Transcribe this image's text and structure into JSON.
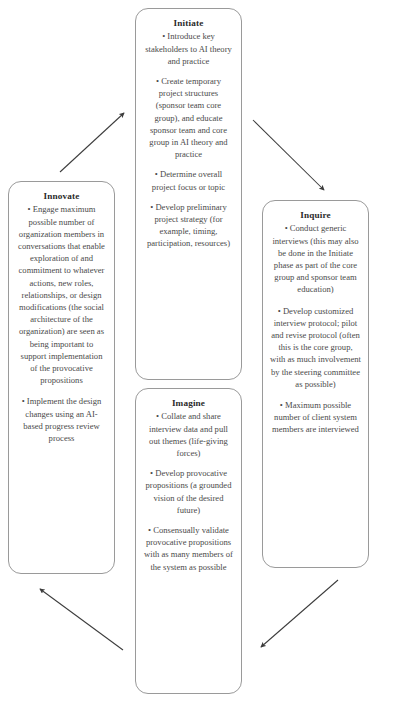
{
  "diagram": {
    "boxes": [
      {
        "id": "initiate",
        "title": "Initiate",
        "bullets": [
          "Introduce key stakeholders to AI theory and practice",
          "Create temporary project structures (sponsor team core group), and educate sponsor team and core group in AI theory and practice",
          "Determine overall project focus or topic",
          "Develop preliminary project strategy (for example, timing, participation, resources)"
        ]
      },
      {
        "id": "inquire",
        "title": "Inquire",
        "bullets": [
          "Conduct generic interviews (this may also be done in the Initiate phase as part of the core group and sponsor team education)",
          "Develop customized interview protocol; pilot and revise protocol (often this is the core group, with as much involvement by the steering committee as possible)",
          "Maximum possible number of client system members are interviewed"
        ]
      },
      {
        "id": "imagine",
        "title": "Imagine",
        "bullets": [
          "Collate and share interview data and pull out themes (life-giving forces)",
          "Develop provocative propositions (a grounded vision of the desired future)",
          "Consensually validate provocative propositions with as many members of the system as possible"
        ]
      },
      {
        "id": "innovate",
        "title": "Innovate",
        "bullets": [
          "Engage maximum possible number of organization members in conversations that enable exploration of and commitment to whatever actions, new roles, relationships, or design modifications (the social architecture of the organization) are seen as being important to support implementation of the provocative propositions",
          "Implement the design changes using an AI-based progress review process"
        ]
      }
    ],
    "arrows": [
      {
        "id": "innovate-to-initiate",
        "from": "innovate",
        "to": "initiate"
      },
      {
        "id": "initiate-to-inquire",
        "from": "initiate",
        "to": "inquire"
      },
      {
        "id": "inquire-to-imagine",
        "from": "inquire",
        "to": "imagine"
      },
      {
        "id": "imagine-to-innovate",
        "from": "imagine",
        "to": "innovate"
      }
    ],
    "colors": {
      "box_border": "#9a9a9a",
      "text": "#4a4a4a",
      "title": "#2b2b2b",
      "arrow": "#3c3c3c",
      "background": "#ffffff"
    }
  },
  "caption": ""
}
